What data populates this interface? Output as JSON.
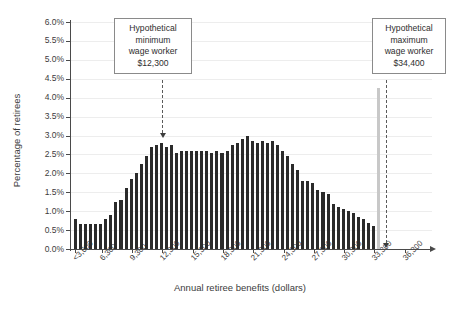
{
  "chart_data": {
    "type": "bar",
    "title": "",
    "subtitle": "",
    "xlabel": "Annual retiree benefits (dollars)",
    "ylabel": "Percentage of retirees",
    "grid": true,
    "legend": null,
    "ylim": [
      0,
      6
    ],
    "ytick_labels": [
      "0.0%",
      "0.5%",
      "1.0%",
      "1.5%",
      "2.0%",
      "2.5%",
      "3.0%",
      "3.5%",
      "4.0%",
      "4.5%",
      "5.0%",
      "5.5%",
      "6.0%"
    ],
    "ytick_values": [
      0,
      0.5,
      1.0,
      1.5,
      2.0,
      2.5,
      3.0,
      3.5,
      4.0,
      4.5,
      5.0,
      5.5,
      6.0
    ],
    "xtick_labels": [
      "<3,600",
      "6,300",
      "9,300",
      "12,300",
      "15,300",
      "18,300",
      "21,300",
      "24,300",
      "27,300",
      "30,300",
      "33,300",
      "36,300"
    ],
    "xtick_values": [
      3600,
      6300,
      9300,
      12300,
      15300,
      18300,
      21300,
      24300,
      27300,
      30300,
      33300,
      36300
    ],
    "bin_width": 500,
    "x_start": 3600,
    "values": [
      0.8,
      0.65,
      0.65,
      0.65,
      0.65,
      0.65,
      0.8,
      0.9,
      1.25,
      1.3,
      1.6,
      1.85,
      2.0,
      2.25,
      2.45,
      2.7,
      2.75,
      2.8,
      2.7,
      2.75,
      2.55,
      2.6,
      2.6,
      2.6,
      2.6,
      2.6,
      2.6,
      2.55,
      2.6,
      2.55,
      2.6,
      2.75,
      2.8,
      2.9,
      3.0,
      2.85,
      2.8,
      2.85,
      2.8,
      2.85,
      2.75,
      2.6,
      2.45,
      2.25,
      2.1,
      1.8,
      1.8,
      1.75,
      1.55,
      1.5,
      1.45,
      1.2,
      1.1,
      1.05,
      1.0,
      0.95,
      0.85,
      0.8,
      0.7,
      0.62
    ],
    "annotations": [
      {
        "id": "min-wage-marker",
        "lines": [
          "Hypothetical",
          "minimum",
          "wage worker",
          "$12,300"
        ],
        "value": 12300,
        "marker": "dashed-arrow"
      },
      {
        "id": "max-wage-marker",
        "lines": [
          "Hypothetical",
          "maximum",
          "wage worker",
          "$34,400"
        ],
        "value": 34400,
        "marker": "dashed-arrow"
      }
    ],
    "colors": {
      "bar": "#2b2b2b",
      "grid": "#ededed",
      "axis": "#4a4a4a",
      "callout_border": "#8a8a8a",
      "vline": "#c8c8c8",
      "text": "#3c3c3c"
    }
  }
}
